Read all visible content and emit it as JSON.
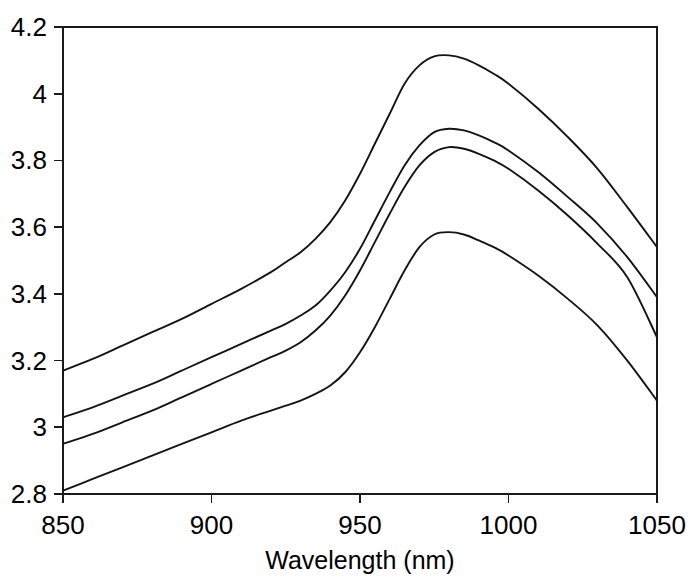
{
  "chart_data": {
    "type": "line",
    "title": "",
    "subtitle": "",
    "xlabel": "Wavelength (nm)",
    "ylabel": "",
    "xlim": [
      850,
      1050
    ],
    "ylim": [
      2.8,
      4.2
    ],
    "xticks": [
      850,
      900,
      950,
      1000,
      1050
    ],
    "xtick_labels": [
      "850",
      "900",
      "950",
      "1000",
      "1050"
    ],
    "yticks": [
      2.8,
      3.0,
      3.2,
      3.4,
      3.6,
      3.8,
      4.0,
      4.2
    ],
    "ytick_labels": [
      "2.8",
      "3",
      "3.2",
      "3.4",
      "3.6",
      "3.8",
      "4",
      "4.2"
    ],
    "grid": false,
    "legend": false,
    "legend_position": "none",
    "line_color": "#141414",
    "axis_color": "#1a1a1a",
    "background_color": "#ffffff",
    "x": [
      850,
      860,
      870,
      880,
      890,
      900,
      910,
      920,
      925,
      930,
      935,
      940,
      945,
      950,
      955,
      960,
      965,
      970,
      975,
      980,
      985,
      990,
      995,
      1000,
      1010,
      1020,
      1030,
      1040,
      1050
    ],
    "series": [
      {
        "name": "curve-1",
        "values": [
          3.17,
          3.205,
          3.245,
          3.285,
          3.325,
          3.37,
          3.415,
          3.465,
          3.495,
          3.525,
          3.565,
          3.615,
          3.68,
          3.76,
          3.85,
          3.94,
          4.03,
          4.085,
          4.112,
          4.115,
          4.105,
          4.085,
          4.06,
          4.03,
          3.955,
          3.87,
          3.775,
          3.66,
          3.54
        ]
      },
      {
        "name": "curve-2",
        "values": [
          3.03,
          3.06,
          3.095,
          3.13,
          3.17,
          3.21,
          3.25,
          3.29,
          3.31,
          3.335,
          3.365,
          3.41,
          3.465,
          3.535,
          3.62,
          3.705,
          3.785,
          3.845,
          3.885,
          3.895,
          3.89,
          3.875,
          3.855,
          3.83,
          3.765,
          3.69,
          3.61,
          3.51,
          3.39
        ]
      },
      {
        "name": "curve-3",
        "values": [
          2.95,
          2.98,
          3.015,
          3.05,
          3.09,
          3.13,
          3.17,
          3.21,
          3.23,
          3.255,
          3.29,
          3.335,
          3.395,
          3.47,
          3.555,
          3.64,
          3.72,
          3.785,
          3.825,
          3.84,
          3.835,
          3.82,
          3.8,
          3.775,
          3.71,
          3.635,
          3.55,
          3.45,
          3.27
        ]
      },
      {
        "name": "curve-4",
        "values": [
          2.81,
          2.845,
          2.88,
          2.915,
          2.95,
          2.985,
          3.02,
          3.05,
          3.065,
          3.08,
          3.1,
          3.125,
          3.165,
          3.225,
          3.3,
          3.385,
          3.47,
          3.54,
          3.578,
          3.585,
          3.578,
          3.56,
          3.54,
          3.515,
          3.455,
          3.385,
          3.305,
          3.2,
          3.08
        ]
      }
    ]
  },
  "axis": {
    "x_title": "Wavelength (nm)"
  }
}
